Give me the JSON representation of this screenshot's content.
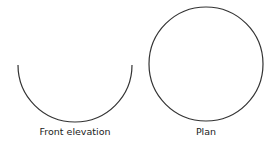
{
  "diagram": {
    "views": [
      {
        "name": "front-elevation",
        "label": "Front elevation",
        "shape": "semicircle",
        "cx": 75,
        "cy": 65,
        "r": 57
      },
      {
        "name": "plan",
        "label": "Plan",
        "shape": "circle",
        "cx": 206,
        "cy": 64,
        "r": 57
      }
    ],
    "stroke_color": "#333333"
  }
}
